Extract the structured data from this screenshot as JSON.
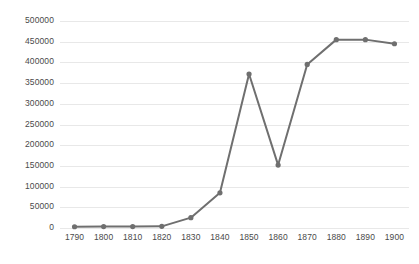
{
  "chart_data": {
    "type": "line",
    "title": "",
    "subtitle": "",
    "xlabel": "",
    "ylabel": "",
    "categories": [
      1790,
      1800,
      1810,
      1820,
      1830,
      1840,
      1850,
      1860,
      1870,
      1880,
      1890,
      1900
    ],
    "x_tick_labels": [
      "1790",
      "1800",
      "1810",
      "1820",
      "1830",
      "1840",
      "1850",
      "1860",
      "1870",
      "1880",
      "1890",
      "1900"
    ],
    "y_tick_labels": [
      "0",
      "50000",
      "100000",
      "150000",
      "200000",
      "250000",
      "300000",
      "350000",
      "400000",
      "450000",
      "500000"
    ],
    "y_ticks": [
      0,
      50000,
      100000,
      150000,
      200000,
      250000,
      300000,
      350000,
      400000,
      450000,
      500000
    ],
    "ylim": [
      0,
      500000
    ],
    "grid": true,
    "grid_axis": "y",
    "legend": false,
    "legend_position": "none",
    "series": [
      {
        "name": "",
        "color": "#6f6f6f",
        "marker": "circle",
        "values": [
          3000,
          3500,
          3500,
          4000,
          25000,
          85000,
          372000,
          152000,
          395000,
          455000,
          455000,
          445000
        ]
      }
    ]
  },
  "style": {
    "line_color": "#6f6f6f",
    "marker_color": "#6f6f6f",
    "grid_color": "#e8e8e8",
    "tick_label_color": "#4a4a4a",
    "background": "#ffffff"
  }
}
